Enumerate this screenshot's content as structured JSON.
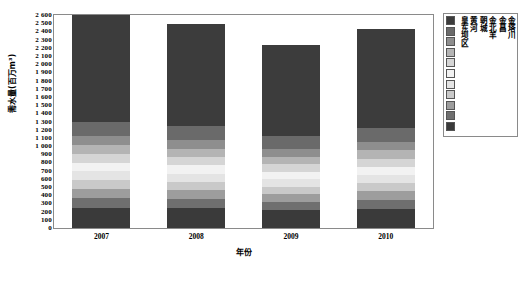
{
  "chart_data": {
    "type": "bar",
    "subtype": "stacked-bar",
    "title": "",
    "xlabel": "年份",
    "ylabel": "需水量(百万m³)",
    "ylim": [
      0,
      2600
    ],
    "ytick_step": 100,
    "grid": false,
    "legend_position": "right-outside",
    "categories": [
      "2007",
      "2008",
      "2009",
      "2010"
    ],
    "ytick_labels": [
      "0",
      "100",
      "200",
      "300",
      "400",
      "500",
      "600",
      "700",
      "800",
      "900",
      "1 000",
      "1 100",
      "1 200",
      "1 300",
      "1 400",
      "1 500",
      "1 600",
      "1 700",
      "1 800",
      "1 900",
      "2 000",
      "2 100",
      "2 200",
      "2 300",
      "2 400",
      "2 500",
      "2 600"
    ],
    "totals": [
      2600,
      2490,
      2240,
      2430
    ],
    "series": [
      {
        "name": "皇东坝区",
        "color": "#3a3a3a",
        "values": [
          250,
          240,
          215,
          235
        ]
      },
      {
        "name": "黄河",
        "color": "#6f6f6f",
        "values": [
          120,
          115,
          103,
          112
        ]
      },
      {
        "name": "朝城",
        "color": "#9d9d9d",
        "values": [
          110,
          105,
          95,
          103
        ]
      },
      {
        "name": "金北羊",
        "color": "#c9c9c9",
        "values": [
          105,
          100,
          90,
          98
        ]
      },
      {
        "name": "金昌",
        "color": "#e4e4e4",
        "values": [
          110,
          105,
          95,
          103
        ]
      },
      {
        "name": "金塔川",
        "color": "#f2f2f2",
        "values": [
          105,
          100,
          90,
          98
        ]
      },
      {
        "name": "清河",
        "color": "#d5d5d5",
        "values": [
          105,
          100,
          90,
          98
        ]
      },
      {
        "name": "泉山",
        "color": "#b4b4b4",
        "values": [
          110,
          105,
          95,
          103
        ]
      },
      {
        "name": "西营",
        "color": "#8e8e8e",
        "values": [
          110,
          105,
          95,
          103
        ]
      },
      {
        "name": "杂木",
        "color": "#6a6a6a",
        "values": [
          175,
          170,
          152,
          165
        ]
      },
      {
        "name": "其他合计",
        "color": "#3c3c3c",
        "values": [
          1300,
          1245,
          1120,
          1212
        ]
      }
    ],
    "legend_order_top_to_bottom": [
      "其他合计",
      "杂木",
      "西营",
      "泉山",
      "清河",
      "金塔川",
      "金昌",
      "金北羊",
      "朝城",
      "黄河",
      "皇东坝区"
    ]
  }
}
